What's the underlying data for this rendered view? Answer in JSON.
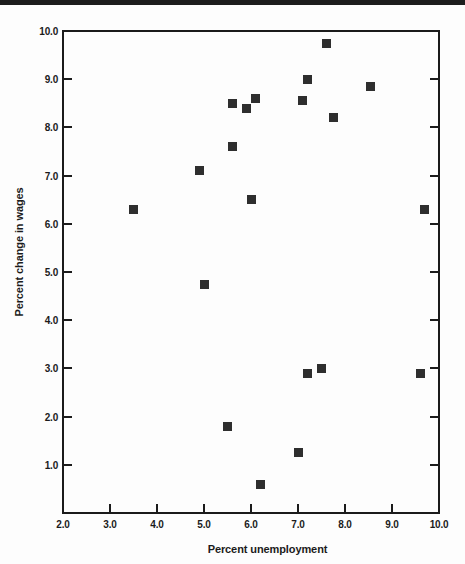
{
  "page": {
    "background": "#fdfdfd",
    "top_rule_color": "#1d1d1d",
    "frame_color": "#1b1b1b",
    "text_color": "#1b1b1b"
  },
  "chart_data": {
    "type": "scatter",
    "title": "",
    "xlabel": "Percent unemployment",
    "ylabel": "Percent change in wages",
    "xlim": [
      2.0,
      10.0
    ],
    "ylim": [
      0.0,
      10.0
    ],
    "grid": false,
    "legend": "none",
    "marker": {
      "shape": "square",
      "color": "#2e2e2e",
      "size_px": 9
    },
    "x_axis": {
      "tick_labels": [
        "2.0",
        "3.0",
        "4.0",
        "5.0",
        "6.0",
        "7.0",
        "8.0",
        "9.0",
        "10.0"
      ],
      "tick_values": [
        2.0,
        3.0,
        4.0,
        5.0,
        6.0,
        7.0,
        8.0,
        9.0,
        10.0
      ],
      "tick_marks": [
        3.0,
        4.0,
        5.0,
        6.0,
        7.0,
        8.0,
        9.0
      ]
    },
    "y_axis": {
      "tick_labels": [
        "1.0",
        "2.0",
        "3.0",
        "4.0",
        "5.0",
        "6.0",
        "7.0",
        "8.0",
        "9.0",
        "10.0"
      ],
      "tick_values": [
        1.0,
        2.0,
        3.0,
        4.0,
        5.0,
        6.0,
        7.0,
        8.0,
        9.0,
        10.0
      ],
      "tick_marks": [
        1.0,
        2.0,
        3.0,
        4.0,
        5.0,
        6.0,
        7.0,
        8.0,
        9.0
      ],
      "mirrored_right_ticks": true
    },
    "points": [
      [
        3.5,
        6.3
      ],
      [
        4.9,
        7.1
      ],
      [
        5.0,
        4.75
      ],
      [
        5.5,
        1.8
      ],
      [
        5.6,
        8.5
      ],
      [
        5.6,
        7.6
      ],
      [
        5.9,
        8.4
      ],
      [
        6.0,
        6.5
      ],
      [
        6.1,
        8.6
      ],
      [
        6.2,
        0.6
      ],
      [
        7.0,
        1.25
      ],
      [
        7.1,
        8.55
      ],
      [
        7.2,
        9.0
      ],
      [
        7.2,
        2.9
      ],
      [
        7.5,
        3.0
      ],
      [
        7.6,
        9.75
      ],
      [
        7.75,
        8.2
      ],
      [
        8.55,
        8.85
      ],
      [
        9.6,
        2.9
      ],
      [
        9.7,
        6.3
      ]
    ]
  }
}
